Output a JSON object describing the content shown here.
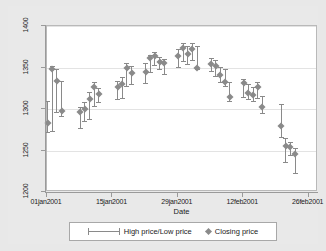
{
  "chart_data": {
    "type": "scatter",
    "title": "",
    "xlabel": "Date",
    "ylabel": "",
    "ylim": [
      1200,
      1400
    ],
    "yticks": [
      1200,
      1250,
      1300,
      1350,
      1400
    ],
    "ytick_labels": [
      "1200",
      "1250",
      "1300",
      "1350",
      "1400"
    ],
    "xlim": [
      "01jan2001",
      "28feb2001"
    ],
    "xticks": [
      "01jan2001",
      "15jan2001",
      "29jan2001",
      "12feb2001",
      "26feb2001"
    ],
    "xtick_labels": [
      "01jan2001",
      "15jan2001",
      "29jan2001",
      "12feb2001",
      "26feb2001"
    ],
    "grid": true,
    "grid_axis": "y",
    "legend_position": "bottom",
    "legend": [
      {
        "label": "High price/Low price",
        "key": "range-bar"
      },
      {
        "label": "Closing price",
        "key": "diamond-marker"
      }
    ],
    "series": [
      {
        "name": "High price/Low price",
        "type": "range",
        "marker_series": "Closing price",
        "points": [
          {
            "date": "01jan2001",
            "day": 0,
            "high": 1310,
            "low": 1272,
            "close": 1283
          },
          {
            "date": "02jan2001",
            "day": 1,
            "high": 1352,
            "low": 1273,
            "close": 1348
          },
          {
            "date": "03jan2001",
            "day": 2,
            "high": 1348,
            "low": 1296,
            "close": 1334
          },
          {
            "date": "04jan2001",
            "day": 3,
            "high": 1334,
            "low": 1292,
            "close": 1298
          },
          {
            "date": "08jan2001",
            "day": 7,
            "high": 1303,
            "low": 1277,
            "close": 1296
          },
          {
            "date": "09jan2001",
            "day": 8,
            "high": 1308,
            "low": 1286,
            "close": 1300
          },
          {
            "date": "10jan2001",
            "day": 9,
            "high": 1320,
            "low": 1288,
            "close": 1312
          },
          {
            "date": "11jan2001",
            "day": 10,
            "high": 1333,
            "low": 1304,
            "close": 1327
          },
          {
            "date": "12jan2001",
            "day": 11,
            "high": 1325,
            "low": 1309,
            "close": 1318
          },
          {
            "date": "16jan2001",
            "day": 15,
            "high": 1334,
            "low": 1312,
            "close": 1327
          },
          {
            "date": "17jan2001",
            "day": 16,
            "high": 1338,
            "low": 1313,
            "close": 1330
          },
          {
            "date": "18jan2001",
            "day": 17,
            "high": 1355,
            "low": 1328,
            "close": 1349
          },
          {
            "date": "19jan2001",
            "day": 18,
            "high": 1352,
            "low": 1330,
            "close": 1343
          },
          {
            "date": "22jan2001",
            "day": 21,
            "high": 1355,
            "low": 1331,
            "close": 1344
          },
          {
            "date": "23jan2001",
            "day": 22,
            "high": 1365,
            "low": 1345,
            "close": 1361
          },
          {
            "date": "24jan2001",
            "day": 23,
            "high": 1369,
            "low": 1353,
            "close": 1364
          },
          {
            "date": "25jan2001",
            "day": 24,
            "high": 1363,
            "low": 1348,
            "close": 1357
          },
          {
            "date": "26jan2001",
            "day": 25,
            "high": 1360,
            "low": 1342,
            "close": 1355
          },
          {
            "date": "29jan2001",
            "day": 28,
            "high": 1372,
            "low": 1351,
            "close": 1364
          },
          {
            "date": "30jan2001",
            "day": 29,
            "high": 1380,
            "low": 1358,
            "close": 1374
          },
          {
            "date": "31jan2001",
            "day": 30,
            "high": 1376,
            "low": 1354,
            "close": 1366
          },
          {
            "date": "01feb2001",
            "day": 31,
            "high": 1379,
            "low": 1359,
            "close": 1372
          },
          {
            "date": "02feb2001",
            "day": 32,
            "high": 1376,
            "low": 1348,
            "close": 1350
          },
          {
            "date": "05feb2001",
            "day": 35,
            "high": 1361,
            "low": 1346,
            "close": 1354
          },
          {
            "date": "06feb2001",
            "day": 36,
            "high": 1359,
            "low": 1340,
            "close": 1352
          },
          {
            "date": "07feb2001",
            "day": 37,
            "high": 1351,
            "low": 1332,
            "close": 1341
          },
          {
            "date": "08feb2001",
            "day": 38,
            "high": 1348,
            "low": 1328,
            "close": 1333
          },
          {
            "date": "09feb2001",
            "day": 39,
            "high": 1332,
            "low": 1310,
            "close": 1315
          },
          {
            "date": "12feb2001",
            "day": 42,
            "high": 1336,
            "low": 1315,
            "close": 1331
          },
          {
            "date": "13feb2001",
            "day": 43,
            "high": 1330,
            "low": 1312,
            "close": 1319
          },
          {
            "date": "14feb2001",
            "day": 44,
            "high": 1326,
            "low": 1310,
            "close": 1317
          },
          {
            "date": "15feb2001",
            "day": 45,
            "high": 1332,
            "low": 1313,
            "close": 1327
          },
          {
            "date": "16feb2001",
            "day": 46,
            "high": 1316,
            "low": 1295,
            "close": 1302
          },
          {
            "date": "20feb2001",
            "day": 50,
            "high": 1306,
            "low": 1266,
            "close": 1280
          },
          {
            "date": "21feb2001",
            "day": 51,
            "high": 1265,
            "low": 1236,
            "close": 1256
          },
          {
            "date": "22feb2001",
            "day": 52,
            "high": 1260,
            "low": 1245,
            "close": 1254
          },
          {
            "date": "23feb2001",
            "day": 53,
            "high": 1253,
            "low": 1223,
            "close": 1246
          }
        ]
      }
    ]
  },
  "axis": {
    "x_title": "Date"
  },
  "colors": {
    "mark": "#8a8a8a",
    "axis": "#9a9a9a",
    "grid": "#e3e3e3",
    "plot_background": "#ffffff",
    "graph_background": "#e9e9e9"
  }
}
